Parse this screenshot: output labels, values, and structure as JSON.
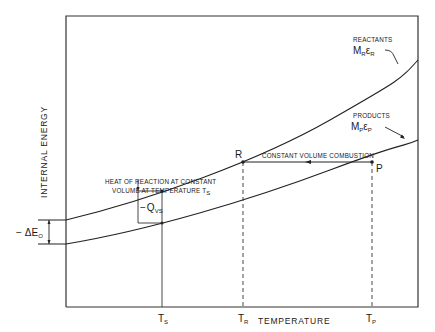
{
  "diagram": {
    "type": "internal-energy vs temperature diagram",
    "axes": {
      "x_label": "TEMPERATURE",
      "y_label": "INTERNAL ENERGY"
    },
    "curves": [
      {
        "id": "reactants",
        "label_title": "REACTANTS",
        "label_symbol": "M",
        "label_sub1": "R",
        "label_eps": "ε",
        "label_sub2": "R"
      },
      {
        "id": "products",
        "label_title": "PRODUCTS",
        "label_symbol": "M",
        "label_sub1": "P",
        "label_eps": "ε",
        "label_sub2": "P"
      }
    ],
    "points": {
      "R": "R",
      "P": "P"
    },
    "process_label": "CONSTANT VOLUME COMBUSTION",
    "heat_label_line1": "HEAT OF REACTION AT CONSTANT",
    "heat_label_line2": "VOLUME AT TEMPERATURE T",
    "heat_label_sub": "S",
    "qvs": {
      "prefix": "−",
      "symbol": "Q",
      "sub": "VS"
    },
    "delta_e": {
      "prefix": "−",
      "symbol": "ΔE",
      "sub": "O"
    },
    "x_ticks": [
      {
        "symbol": "T",
        "sub": "S"
      },
      {
        "symbol": "T",
        "sub": "R"
      },
      {
        "symbol": "T",
        "sub": "P"
      }
    ]
  }
}
